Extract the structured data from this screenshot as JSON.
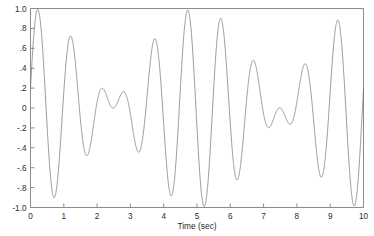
{
  "figure": {
    "background_color": "#ffffff",
    "frame_color": "#8c8c8c",
    "line_color": "#6e6e6e",
    "text_color": "#2b2b2b"
  },
  "chart_data": {
    "type": "line",
    "title": "",
    "subtitle": "",
    "xlabel": "Time (sec)",
    "ylabel": "",
    "xlim": [
      0,
      10
    ],
    "ylim": [
      -1.0,
      1.0
    ],
    "grid": false,
    "legend": null,
    "legend_position": "none",
    "xticks": [
      0,
      1,
      2,
      3,
      4,
      5,
      6,
      7,
      8,
      9,
      10
    ],
    "xticklabels": [
      "0",
      "1",
      "2",
      "3",
      "4",
      "5",
      "6",
      "7",
      "8",
      "9",
      "10"
    ],
    "yticks": [
      -1.0,
      -0.8,
      -0.6,
      -0.4,
      -0.2,
      0,
      0.2,
      0.4,
      0.6,
      0.8,
      1.0
    ],
    "yticklabels": [
      "-1.0",
      "-.8",
      "-.6",
      "-.4",
      "-.2",
      "0",
      ".2",
      ".4",
      ".6",
      ".8",
      "1.0"
    ],
    "annotations": [],
    "series": [
      {
        "name": "beat signal",
        "color": "#6e6e6e",
        "linewidth": 0.7,
        "formula": "0.5*sin(2*pi*0.9*t + 0.2) + 0.5*sin(2*pi*1.1*t + 0.2)",
        "components": [
          {
            "amplitude": 0.5,
            "frequency_hz": 0.9,
            "phase_rad": 0.2
          },
          {
            "amplitude": 0.5,
            "frequency_hz": 1.1,
            "phase_rad": 0.2
          }
        ],
        "envelope_frequency_hz": 0.1,
        "carrier_frequency_hz": 1.0,
        "samples": 3000,
        "x": [
          0,
          10
        ],
        "y_range": [
          -1.0,
          1.0
        ],
        "key_points": [
          {
            "t": 0.0,
            "y": 0.2
          },
          {
            "t": 0.25,
            "y": 1.0
          },
          {
            "t": 0.75,
            "y": -1.0
          },
          {
            "t": 1.25,
            "y": 0.95
          },
          {
            "t": 1.75,
            "y": -0.95
          },
          {
            "t": 2.25,
            "y": 0.8
          },
          {
            "t": 2.75,
            "y": -0.8
          },
          {
            "t": 3.25,
            "y": 0.6
          },
          {
            "t": 3.75,
            "y": -0.6
          },
          {
            "t": 4.25,
            "y": 0.35
          },
          {
            "t": 4.75,
            "y": -0.35
          },
          {
            "t": 5.0,
            "y": 0.1
          },
          {
            "t": 5.25,
            "y": -0.35
          },
          {
            "t": 5.75,
            "y": 0.35
          },
          {
            "t": 6.25,
            "y": -0.6
          },
          {
            "t": 6.75,
            "y": 0.6
          },
          {
            "t": 7.25,
            "y": -0.8
          },
          {
            "t": 7.75,
            "y": 0.8
          },
          {
            "t": 8.25,
            "y": -0.95
          },
          {
            "t": 8.75,
            "y": 0.95
          },
          {
            "t": 9.25,
            "y": -1.0
          },
          {
            "t": 9.75,
            "y": 1.0
          },
          {
            "t": 10.0,
            "y": 0.5
          }
        ]
      }
    ]
  }
}
